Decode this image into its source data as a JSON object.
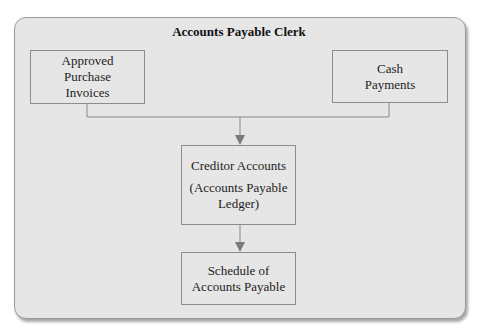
{
  "diagram": {
    "title": "Accounts Payable Clerk",
    "nodes": {
      "approved": {
        "lines": [
          "Approved",
          "Purchase",
          "Invoices"
        ]
      },
      "cash": {
        "lines": [
          "Cash",
          "Payments"
        ]
      },
      "creditor": {
        "line1": "Creditor Accounts",
        "line2": "(Accounts Payable",
        "line3": "Ledger)"
      },
      "schedule": {
        "lines": [
          "Schedule of",
          "Accounts Payable"
        ]
      }
    },
    "edges": [
      {
        "from": "Approved Purchase Invoices",
        "to": "Creditor Accounts (Accounts Payable Ledger)"
      },
      {
        "from": "Cash Payments",
        "to": "Creditor Accounts (Accounts Payable Ledger)"
      },
      {
        "from": "Creditor Accounts (Accounts Payable Ledger)",
        "to": "Schedule of Accounts Payable"
      }
    ],
    "colors": {
      "panel": "#e6e6e6",
      "border": "#8c8c8c",
      "arrow": "#7a7a7a"
    }
  }
}
